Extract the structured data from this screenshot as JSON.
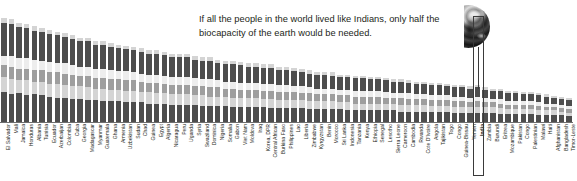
{
  "caption": {
    "line1": "If all the people in the world lived like Indians, only half the",
    "line2": "biocapacity of the earth would be needed."
  },
  "globe": {
    "alt": "half-earth-globe"
  },
  "highlight": {
    "country": "India"
  },
  "colors": {
    "dark": "#4d4d4d",
    "mid": "#9e9e9e",
    "light": "#d4d4d4",
    "pale": "#ededed",
    "axis": "#6f6f6f",
    "text": "#231f20",
    "outline": "#3a3a3a"
  },
  "chart_data": {
    "type": "bar",
    "title": "",
    "xlabel": "",
    "ylabel": "",
    "stacked": true,
    "grid": false,
    "legend": "none",
    "ylim": [
      0,
      100
    ],
    "series": [
      {
        "name": "built-up-land",
        "color": "#4d4d4d"
      },
      {
        "name": "cropland",
        "color": "#d4d4d4"
      },
      {
        "name": "grazing-land",
        "color": "#9e9e9e"
      },
      {
        "name": "forest-land",
        "color": "#ededed"
      },
      {
        "name": "carbon-footprint",
        "color": "#4d4d4d"
      },
      {
        "name": "fishing-grounds",
        "color": "#d4d4d4"
      }
    ],
    "categories": [
      "El Salvador",
      "Mali",
      "Jamaica",
      "Honduras",
      "Albania",
      "Tunisia",
      "Ecuador",
      "Azerbaijan",
      "Colombia",
      "Cuba",
      "Georgia",
      "Madagascar",
      "Myanmar",
      "Guatemala",
      "Ghana",
      "Armenia",
      "Uzbekistan",
      "Sudan",
      "Chad",
      "Guinea",
      "Egypt",
      "Algeria",
      "Nicaragua",
      "Peru",
      "Uganda",
      "Syria",
      "Swaziland",
      "Dominica",
      "Nigeria",
      "Somalia",
      "Gabon",
      "Viet Nam",
      "Moldova",
      "Iraq",
      "Korea, DPR",
      "Central African",
      "Burkina Faso",
      "Philippines",
      "Lao",
      "Liberia",
      "Zimbabwe",
      "Kyrgyzstan",
      "Benin",
      "Morocco",
      "Sri Lanka",
      "Indonesia",
      "Tanzania",
      "Kenya",
      "Ethiopia",
      "Senegal",
      "Lesotho",
      "Sierra Leone",
      "Cameroon",
      "Cambodia",
      "Rwanda",
      "Cote D'Ivoire",
      "Angola",
      "Tajikistan",
      "Togo",
      "Congo",
      "Guinea-Bissau",
      "Yemen",
      "India",
      "Zambia",
      "Burundi",
      "Eritrea",
      "Mozambique",
      "Pakistan",
      "Congo",
      "Palestinian",
      "Malawi",
      "Haiti",
      "Afghanistan",
      "Bangladesh",
      "Timor-Leste"
    ],
    "stacks": [
      [
        26,
        13,
        10,
        8,
        29,
        4
      ],
      [
        24,
        13,
        11,
        9,
        28,
        4
      ],
      [
        25,
        11,
        10,
        9,
        27,
        4
      ],
      [
        23,
        13,
        10,
        9,
        26,
        4
      ],
      [
        24,
        11,
        10,
        9,
        25,
        4
      ],
      [
        23,
        12,
        10,
        8,
        25,
        3
      ],
      [
        22,
        11,
        10,
        9,
        24,
        4
      ],
      [
        21,
        12,
        10,
        8,
        24,
        3
      ],
      [
        21,
        11,
        10,
        9,
        23,
        3
      ],
      [
        20,
        11,
        10,
        8,
        23,
        3
      ],
      [
        20,
        11,
        9,
        8,
        22,
        3
      ],
      [
        19,
        11,
        10,
        8,
        22,
        3
      ],
      [
        19,
        10,
        9,
        8,
        21,
        3
      ],
      [
        18,
        11,
        9,
        8,
        21,
        3
      ],
      [
        18,
        10,
        9,
        8,
        20,
        3
      ],
      [
        18,
        10,
        9,
        7,
        20,
        3
      ],
      [
        17,
        10,
        9,
        8,
        19,
        3
      ],
      [
        17,
        10,
        9,
        7,
        19,
        3
      ],
      [
        17,
        9,
        9,
        7,
        19,
        3
      ],
      [
        16,
        10,
        8,
        7,
        18,
        3
      ],
      [
        16,
        9,
        9,
        7,
        18,
        3
      ],
      [
        16,
        9,
        8,
        7,
        18,
        3
      ],
      [
        15,
        9,
        8,
        7,
        17,
        3
      ],
      [
        15,
        9,
        8,
        7,
        17,
        3
      ],
      [
        15,
        9,
        8,
        7,
        17,
        3
      ],
      [
        15,
        8,
        8,
        7,
        16,
        3
      ],
      [
        14,
        9,
        8,
        6,
        16,
        3
      ],
      [
        14,
        8,
        8,
        7,
        16,
        3
      ],
      [
        14,
        8,
        8,
        6,
        15,
        3
      ],
      [
        14,
        8,
        7,
        6,
        15,
        3
      ],
      [
        13,
        8,
        8,
        6,
        15,
        3
      ],
      [
        13,
        8,
        7,
        6,
        15,
        3
      ],
      [
        13,
        8,
        7,
        6,
        14,
        3
      ],
      [
        13,
        8,
        7,
        6,
        14,
        3
      ],
      [
        13,
        7,
        7,
        6,
        14,
        3
      ],
      [
        12,
        8,
        7,
        6,
        14,
        3
      ],
      [
        12,
        7,
        7,
        6,
        13,
        3
      ],
      [
        12,
        7,
        7,
        6,
        13,
        3
      ],
      [
        12,
        7,
        7,
        5,
        13,
        3
      ],
      [
        12,
        7,
        6,
        6,
        12,
        3
      ],
      [
        11,
        7,
        7,
        5,
        12,
        3
      ],
      [
        11,
        7,
        6,
        5,
        12,
        2
      ],
      [
        11,
        7,
        6,
        5,
        12,
        2
      ],
      [
        11,
        7,
        6,
        5,
        11,
        3
      ],
      [
        11,
        6,
        6,
        5,
        11,
        2
      ],
      [
        10,
        7,
        6,
        5,
        11,
        2
      ],
      [
        10,
        6,
        6,
        5,
        11,
        2
      ],
      [
        10,
        6,
        6,
        5,
        11,
        2
      ],
      [
        10,
        6,
        6,
        5,
        10,
        2
      ],
      [
        10,
        6,
        6,
        5,
        10,
        2
      ],
      [
        10,
        6,
        5,
        5,
        10,
        2
      ],
      [
        10,
        6,
        5,
        4,
        10,
        2
      ],
      [
        9,
        6,
        6,
        4,
        10,
        2
      ],
      [
        9,
        6,
        5,
        5,
        9,
        2
      ],
      [
        9,
        6,
        5,
        4,
        9,
        2
      ],
      [
        9,
        6,
        5,
        4,
        9,
        2
      ],
      [
        9,
        5,
        5,
        4,
        9,
        2
      ],
      [
        9,
        5,
        5,
        4,
        9,
        2
      ],
      [
        9,
        5,
        5,
        4,
        8,
        2
      ],
      [
        8,
        5,
        5,
        4,
        8,
        2
      ],
      [
        8,
        5,
        5,
        4,
        8,
        2
      ],
      [
        8,
        5,
        4,
        4,
        8,
        2
      ],
      [
        8,
        5,
        5,
        4,
        8,
        2
      ],
      [
        8,
        5,
        4,
        4,
        7,
        2
      ],
      [
        8,
        5,
        4,
        3,
        7,
        2
      ],
      [
        7,
        5,
        4,
        4,
        7,
        2
      ],
      [
        7,
        4,
        4,
        3,
        7,
        2
      ],
      [
        7,
        4,
        4,
        3,
        7,
        2
      ],
      [
        7,
        4,
        4,
        3,
        6,
        2
      ],
      [
        7,
        4,
        4,
        3,
        6,
        2
      ],
      [
        6,
        4,
        4,
        3,
        6,
        2
      ],
      [
        6,
        4,
        3,
        3,
        6,
        2
      ],
      [
        6,
        4,
        3,
        3,
        5,
        2
      ],
      [
        6,
        3,
        3,
        3,
        5,
        2
      ],
      [
        5,
        3,
        3,
        3,
        5,
        2
      ]
    ]
  }
}
